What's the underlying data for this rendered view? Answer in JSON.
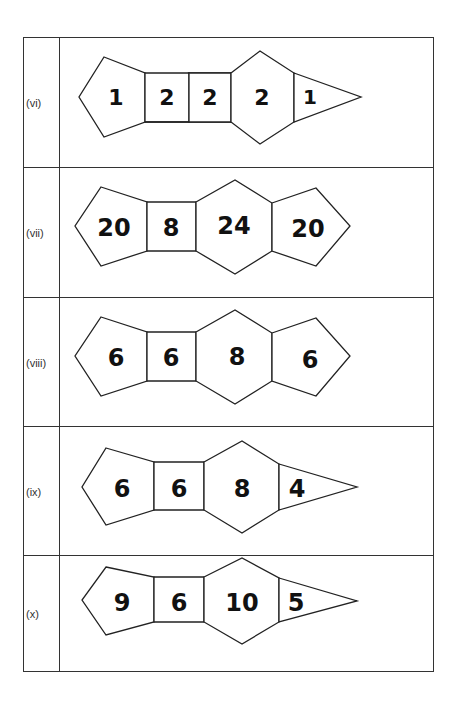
{
  "rows": [
    {
      "label": "(vi)",
      "faces": [
        "1",
        "2",
        "2",
        "2",
        "1"
      ]
    },
    {
      "label": "(vii)",
      "faces": [
        "20",
        "8",
        "24",
        "20"
      ]
    },
    {
      "label": "(viii)",
      "faces": [
        "6",
        "6",
        "8",
        "6"
      ]
    },
    {
      "label": "(ix)",
      "faces": [
        "6",
        "6",
        "8",
        "4"
      ]
    },
    {
      "label": "(x)",
      "faces": [
        "9",
        "6",
        "10",
        "5"
      ]
    }
  ]
}
